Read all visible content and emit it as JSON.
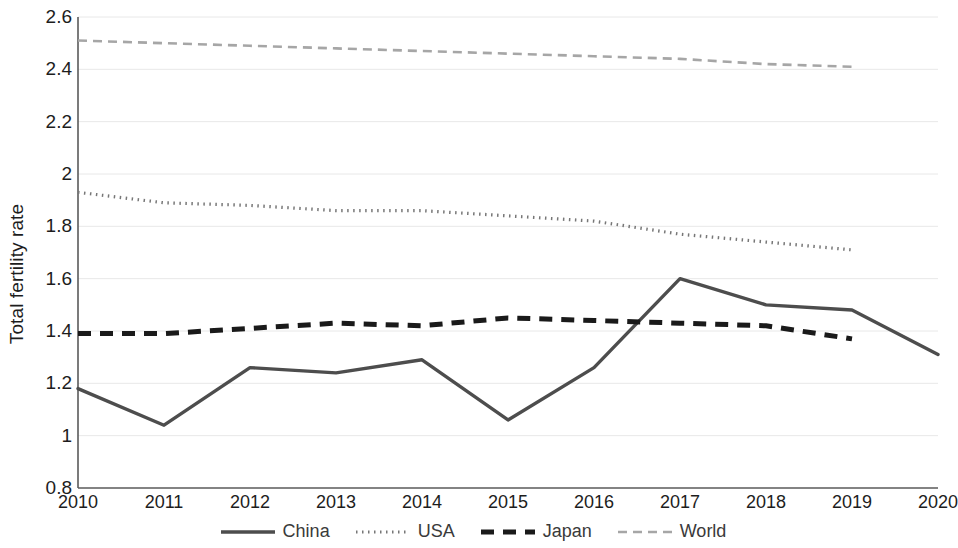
{
  "chart_data": {
    "type": "line",
    "title": "",
    "xlabel": "",
    "ylabel": "Total fertility rate",
    "x": [
      2010,
      2011,
      2012,
      2013,
      2014,
      2015,
      2016,
      2017,
      2018,
      2019,
      2020
    ],
    "categories": [
      "2010",
      "2011",
      "2012",
      "2013",
      "2014",
      "2015",
      "2016",
      "2017",
      "2018",
      "2019",
      "2020"
    ],
    "xlim": [
      2010,
      2020
    ],
    "ylim": [
      0.8,
      2.6
    ],
    "yticks": [
      0.8,
      1,
      1.2,
      1.4,
      1.6,
      1.8,
      2,
      2.2,
      2.4,
      2.6
    ],
    "ytick_labels": [
      "0.8",
      "1",
      "1.2",
      "1.4",
      "1.6",
      "1.8",
      "2",
      "2.2",
      "2.4",
      "2.6"
    ],
    "grid": true,
    "legend_position": "bottom",
    "series": [
      {
        "name": "China",
        "style": "solid",
        "color": "#4d4d4d",
        "values": [
          1.18,
          1.04,
          1.26,
          1.24,
          1.29,
          1.06,
          1.26,
          1.6,
          1.5,
          1.48,
          1.31
        ]
      },
      {
        "name": "USA",
        "style": "dotted",
        "color": "#777777",
        "values": [
          1.93,
          1.89,
          1.88,
          1.86,
          1.86,
          1.84,
          1.82,
          1.77,
          1.74,
          1.71,
          null
        ]
      },
      {
        "name": "Japan",
        "style": "dashed",
        "color": "#1a1a1a",
        "values": [
          1.39,
          1.39,
          1.41,
          1.43,
          1.42,
          1.45,
          1.44,
          1.43,
          1.42,
          1.37,
          null
        ]
      },
      {
        "name": "World",
        "style": "dashed-light",
        "color": "#a6a6a6",
        "values": [
          2.51,
          2.5,
          2.49,
          2.48,
          2.47,
          2.46,
          2.45,
          2.44,
          2.42,
          2.41,
          null
        ]
      }
    ]
  },
  "legend": {
    "items": [
      {
        "label": "China"
      },
      {
        "label": "USA"
      },
      {
        "label": "Japan"
      },
      {
        "label": "World"
      }
    ]
  }
}
